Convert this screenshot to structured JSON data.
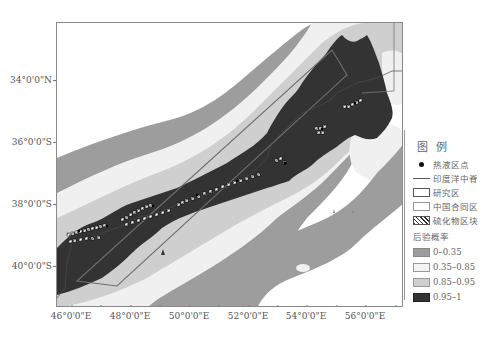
{
  "map": {
    "y_axis_labels": [
      {
        "label": "34°0'0\"N",
        "y": 80
      },
      {
        "label": "36°0'0\"S",
        "y": 142
      },
      {
        "label": "38°0'0\"S",
        "y": 204
      },
      {
        "label": "40°0'0\"S",
        "y": 266
      }
    ],
    "x_axis_labels": [
      {
        "label": "46°0'0\"E",
        "x": 71
      },
      {
        "label": "48°0'0\"E",
        "x": 130
      },
      {
        "label": "50°0'0\"E",
        "x": 189
      },
      {
        "label": "52°0'0\"E",
        "x": 248
      },
      {
        "label": "54°0'0\"E",
        "x": 306
      },
      {
        "label": "56°0'0\"E",
        "x": 365
      }
    ],
    "colors": {
      "prob_0_035": "#9d9d9d",
      "prob_035_085": "#f0f0f0",
      "prob_085_095": "#cfcfcf",
      "prob_095_1": "#333333",
      "ridge_line": "#4a4a4a",
      "study_area_border": "#6e6e6e",
      "frame": "#8a8a8a"
    }
  },
  "legend": {
    "title": "图例",
    "items": [
      {
        "symbol": "dot",
        "label": "热液区点"
      },
      {
        "symbol": "line",
        "label": "印度洋中脊"
      },
      {
        "symbol": "box-outline",
        "label": "研究区"
      },
      {
        "symbol": "box-light",
        "label": "中国合同区"
      },
      {
        "symbol": "hatched",
        "label": "硫化物区块"
      }
    ],
    "subtitle": "后验概率",
    "classes": [
      {
        "label": "0–0.35",
        "color": "#9d9d9d"
      },
      {
        "label": "0.35–0.85",
        "color": "#f3f3f3"
      },
      {
        "label": "0.85–0.95",
        "color": "#cfcfcf"
      },
      {
        "label": "0.95–1",
        "color": "#333333"
      }
    ]
  }
}
